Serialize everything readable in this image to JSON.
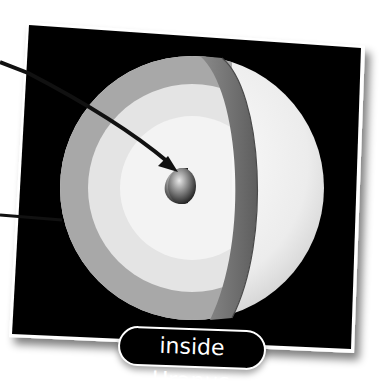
{
  "diagram": {
    "title": "inside Uranus",
    "layers": [
      {
        "name": "outer-atmosphere",
        "color": "#f2f2f2"
      },
      {
        "name": "mantle-outer-band",
        "color": "#a9a9a9"
      },
      {
        "name": "mantle-inner",
        "color": "#e6e6e6"
      },
      {
        "name": "cut-edge-band",
        "color": "#6e6e6e"
      },
      {
        "name": "core",
        "color": "#5a5a5a"
      }
    ],
    "pointers": [
      {
        "name": "pointer-to-core",
        "from": [
          0,
          60
        ],
        "to": [
          182,
          172
        ]
      },
      {
        "name": "pointer-to-mantle",
        "from": [
          0,
          215
        ],
        "to": [
          62,
          220
        ]
      }
    ],
    "colors": {
      "card_background": "#000000",
      "card_border": "#ffffff",
      "label_text": "#ffffff",
      "page_background": "#ffffff"
    }
  }
}
